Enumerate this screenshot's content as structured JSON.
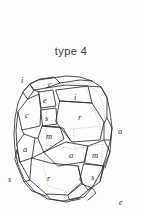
{
  "figure": {
    "caption": "type 4",
    "kind": "crystal-habit-line-drawing",
    "background_color": "#fdfdfc",
    "ink_color": "#2e2e2e",
    "hidden_edge_color": "#9a9a9a"
  },
  "face_labels": [
    {
      "id": "label-i-top-left",
      "text": "i",
      "x": 22,
      "y": 80
    },
    {
      "id": "label-c-top",
      "text": "c",
      "x": 50,
      "y": 85
    },
    {
      "id": "label-e-upper",
      "text": "e",
      "x": 45,
      "y": 99
    },
    {
      "id": "label-i-upper-right",
      "text": "i",
      "x": 76,
      "y": 99
    },
    {
      "id": "label-c-left",
      "text": "c",
      "x": 24,
      "y": 117
    },
    {
      "id": "label-r-upper-right",
      "text": "r",
      "x": 80,
      "y": 118
    },
    {
      "id": "label-s-upper-left",
      "text": "s",
      "x": 41,
      "y": 128
    },
    {
      "id": "label-a-right",
      "text": "a",
      "x": 118,
      "y": 134
    },
    {
      "id": "label-m-left",
      "text": "m",
      "x": 42,
      "y": 146
    },
    {
      "id": "label-a-lower-left",
      "text": "a",
      "x": 23,
      "y": 154
    },
    {
      "id": "label-a-center",
      "text": "a",
      "x": 72,
      "y": 157
    },
    {
      "id": "label-m-lower-right",
      "text": "m",
      "x": 96,
      "y": 157
    },
    {
      "id": "label-s-lower-left",
      "text": "s",
      "x": 10,
      "y": 182
    },
    {
      "id": "label-r-lower",
      "text": "r",
      "x": 47,
      "y": 180
    },
    {
      "id": "label-s-lower-right",
      "text": "s",
      "x": 93,
      "y": 180
    },
    {
      "id": "label-e-bottom",
      "text": "e",
      "x": 120,
      "y": 204
    }
  ],
  "geometry": {
    "outline": "M 27,92 L 30,83 L 38,80 L 66,76 L 86,78 L 101,86 L 108,96 L 110,112 L 112,128 L 109,142 L 105,156 L 100,172 L 92,186 L 78,197 L 58,201 L 40,196 L 26,185 L 18,170 L 15,152 L 14,134 L 16,116 L 20,102 Z",
    "note": "approximate silhouette of the drawn crystal"
  }
}
